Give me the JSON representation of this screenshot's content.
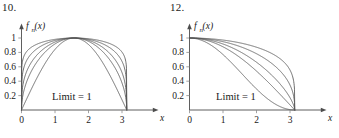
{
  "figures": [
    {
      "number": "10.",
      "y_axis_title": "f",
      "y_axis_sub": "n",
      "y_axis_arg": "(x)",
      "x_axis_title": "x",
      "annotation": "Limit = 1",
      "chart_data": {
        "type": "line",
        "title": "10.",
        "xlabel": "x",
        "ylabel": "f_n(x)",
        "annotation": "Limit = 1",
        "xlim": [
          0,
          3.45
        ],
        "ylim": [
          0,
          1.12
        ],
        "xticks": [
          0,
          1,
          2,
          3
        ],
        "xticklabels": [
          "0",
          "1",
          "2",
          "3"
        ],
        "yticks": [
          0.2,
          0.4,
          0.6,
          0.8,
          1
        ],
        "yticklabels": [
          "0.2",
          "0.4",
          "0.6",
          "0.8",
          "1"
        ],
        "grid": false,
        "legend": "none",
        "formula": "f_n(x) = (sin x)^(1/n) on [0, pi]",
        "series": [
          {
            "name": "n = 1",
            "exponent": 1.0
          },
          {
            "name": "n = 2",
            "exponent": 0.5
          },
          {
            "name": "n = 3",
            "exponent": 0.3333
          },
          {
            "name": "n = 5",
            "exponent": 0.2
          },
          {
            "name": "n = 9",
            "exponent": 0.1111
          }
        ],
        "x_zero_crossings": [
          0,
          3.1416
        ],
        "peak_value": 1,
        "peak_x": 1.5708
      }
    },
    {
      "number": "12.",
      "y_axis_title": "f",
      "y_axis_sub": "n",
      "y_axis_arg": "(x)",
      "x_axis_title": "x",
      "annotation": "Limit = 1",
      "chart_data": {
        "type": "line",
        "title": "12.",
        "xlabel": "x",
        "ylabel": "f_n(x)",
        "annotation": "Limit = 1",
        "xlim": [
          0,
          3.45
        ],
        "ylim": [
          0,
          1.12
        ],
        "xticks": [
          0,
          1,
          2,
          3
        ],
        "xticklabels": [
          "0",
          "1",
          "2",
          "3"
        ],
        "yticks": [
          0.2,
          0.4,
          0.6,
          0.8,
          1
        ],
        "yticklabels": [
          "0.2",
          "0.4",
          "0.6",
          "0.8",
          "1"
        ],
        "grid": false,
        "legend": "none",
        "formula": "f_n(x) = (cos(x/2))^(2/n) on [0, pi]",
        "series": [
          {
            "name": "n = 1",
            "exponent": 2.0
          },
          {
            "name": "n = 2",
            "exponent": 1.0
          },
          {
            "name": "n = 3",
            "exponent": 0.6667
          },
          {
            "name": "n = 5",
            "exponent": 0.4
          },
          {
            "name": "n = 9",
            "exponent": 0.2222
          }
        ],
        "x_zero_crossings": [
          3.1416
        ],
        "start_value": 1,
        "start_x": 0
      }
    }
  ]
}
